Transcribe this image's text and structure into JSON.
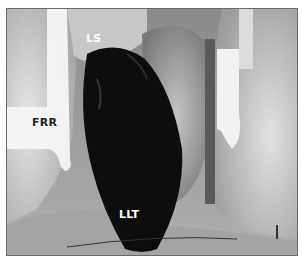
{
  "figure": {
    "labels": [
      {
        "id": "ls",
        "text": "LS",
        "color": "#ffffff"
      },
      {
        "id": "frr",
        "text": "FRR",
        "color": "#222222"
      },
      {
        "id": "llt",
        "text": "LLT",
        "color": "#ffffff"
      }
    ]
  },
  "colors": {
    "frame_border": "#6a6a6a",
    "background": "#ffffff",
    "tissue_light": "#d8d8d8",
    "tissue_mid": "#9a9a9a",
    "lobe_dark": "#0d0d0d",
    "retractor": "#f4f4f4"
  }
}
